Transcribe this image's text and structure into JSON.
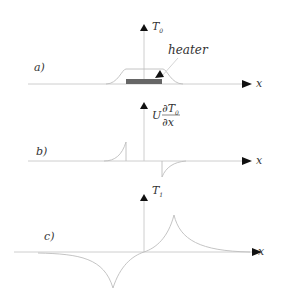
{
  "diagram": {
    "panels": [
      {
        "id": "a",
        "label": "a)",
        "y_axis_label": "T",
        "y_axis_subscript": "0",
        "x_axis_label": "x",
        "annotation": "heater",
        "curve_description": "Trapezoidal temperature profile T0 centered over heater, flat top, smooth rising/falling edges"
      },
      {
        "id": "b",
        "label": "b)",
        "y_axis_label_prefix": "U",
        "y_axis_label_num": "∂T",
        "y_axis_label_num_sub": "0",
        "y_axis_label_den": "∂x",
        "x_axis_label": "x",
        "curve_description": "Derivative U dT0/dx: positive spike at left edge of heater, negative spike at right edge, each decaying away"
      },
      {
        "id": "c",
        "label": "c)",
        "y_axis_label": "T",
        "y_axis_subscript": "1",
        "x_axis_label": "x",
        "curve_description": "First-order temperature T1: antisymmetric, negative cusp left of center, positive cusp right of center"
      }
    ],
    "colors": {
      "axis": "#c8c8c8",
      "curve": "#bdbdbd",
      "heater": "#666666",
      "arrow": "#111111",
      "text": "#333333"
    }
  }
}
